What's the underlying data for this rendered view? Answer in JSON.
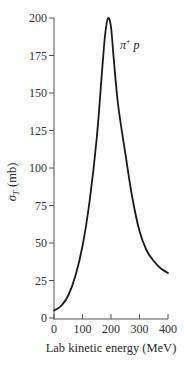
{
  "chart_data": {
    "type": "line",
    "title": "",
    "xlabel": "Lab kinetic energy (MeV)",
    "ylabel": "σT (mb)",
    "ylabel_main": "σ",
    "ylabel_sub": "T",
    "ylabel_unit": "(mb)",
    "xlim": [
      0,
      400
    ],
    "ylim": [
      0,
      200
    ],
    "grid": false,
    "x_ticks": [
      0,
      100,
      200,
      300,
      400
    ],
    "y_ticks": [
      0,
      25,
      50,
      75,
      100,
      125,
      150,
      175,
      200
    ],
    "series": [
      {
        "name": "π+ p",
        "label_main": "π",
        "label_sup": "+",
        "label_tail": " p",
        "x": [
          0,
          25,
          50,
          75,
          100,
          125,
          150,
          170,
          180,
          190,
          200,
          210,
          225,
          250,
          275,
          300,
          325,
          350,
          375,
          400
        ],
        "values": [
          5,
          8,
          15,
          28,
          48,
          78,
          120,
          168,
          190,
          200,
          194,
          172,
          142,
          110,
          80,
          58,
          45,
          38,
          33,
          30
        ]
      }
    ],
    "annotations": [
      {
        "text": "π+ p",
        "x": 225,
        "y": 178
      }
    ]
  },
  "colors": {
    "curve": "#1a1a1a",
    "axis": "#555555",
    "text": "#2a2a2a"
  }
}
